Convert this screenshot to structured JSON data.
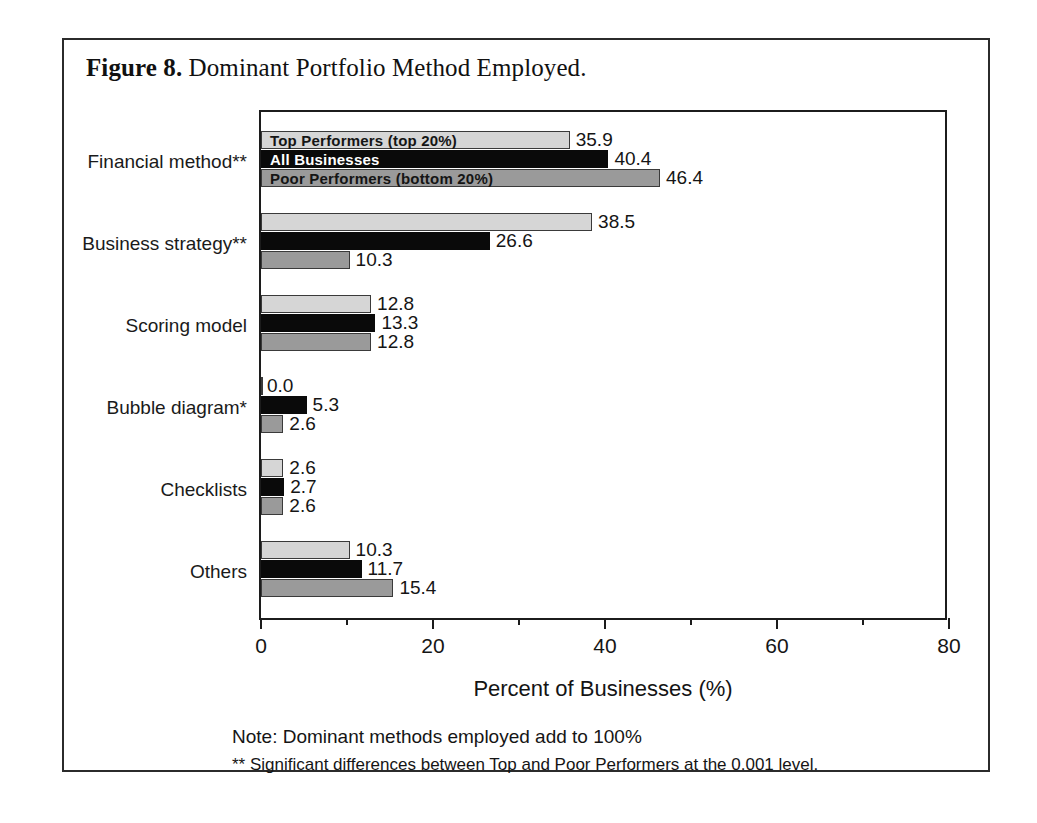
{
  "figure": {
    "caption_label": "Figure 8.",
    "caption_text": " Dominant Portfolio Method Employed."
  },
  "notes": {
    "line1": "Note: Dominant methods employed add to 100%",
    "line2": "** Significant differences between Top and Poor Performers at the 0.001 level."
  },
  "legend": {
    "series": [
      {
        "key": "top",
        "label": "Top Performers (top 20%)",
        "color": "#d6d6d6"
      },
      {
        "key": "all",
        "label": "All Businesses",
        "color": "#0a0a0a"
      },
      {
        "key": "poor",
        "label": "Poor Performers (bottom 20%)",
        "color": "#9a9a9a"
      }
    ]
  },
  "axis": {
    "x_title": "Percent of Businesses (%)",
    "x_ticks_major": [
      "0",
      "20",
      "40",
      "60",
      "80"
    ],
    "x_ticks_major_values": [
      0,
      20,
      40,
      60,
      80
    ],
    "x_ticks_minor_values": [
      10,
      30,
      50,
      70
    ],
    "x_min": 0,
    "x_max": 80
  },
  "chart_data": {
    "type": "bar",
    "orientation": "horizontal",
    "title": "Figure 8. Dominant Portfolio Method Employed.",
    "xlabel": "Percent of Businesses (%)",
    "ylabel": "",
    "xlim": [
      0,
      80
    ],
    "grid": false,
    "legend_position": "inside-first-group",
    "categories": [
      "Financial method**",
      "Business strategy**",
      "Scoring model",
      "Bubble diagram*",
      "Checklists",
      "Others"
    ],
    "series": [
      {
        "name": "Top Performers (top 20%)",
        "color": "#d6d6d6",
        "values": [
          35.9,
          38.5,
          12.8,
          0.0,
          2.6,
          10.3
        ],
        "labels": [
          "35.9",
          "38.5",
          "12.8",
          "0.0",
          "2.6",
          "10.3"
        ]
      },
      {
        "name": "All Businesses",
        "color": "#0a0a0a",
        "values": [
          40.4,
          26.6,
          13.3,
          5.3,
          2.7,
          11.7
        ],
        "labels": [
          "40.4",
          "26.6",
          "13.3",
          "5.3",
          "2.7",
          "11.7"
        ]
      },
      {
        "name": "Poor Performers (bottom 20%)",
        "color": "#9a9a9a",
        "values": [
          46.4,
          10.3,
          12.8,
          2.6,
          2.6,
          15.4
        ],
        "labels": [
          "46.4",
          "10.3",
          "12.8",
          "2.6",
          "2.6",
          "15.4"
        ]
      }
    ],
    "annotations": [
      "Note: Dominant methods employed add to 100%",
      "** Significant differences between Top and Poor Performers at the 0.001 level."
    ]
  }
}
